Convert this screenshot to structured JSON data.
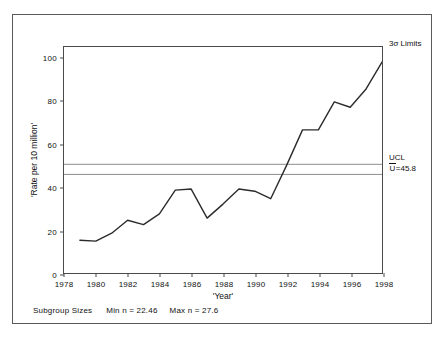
{
  "chart_data": {
    "type": "line",
    "title": "",
    "xlabel": "'Year'",
    "ylabel": "'Rate per 10 million'",
    "x": [
      1979,
      1980,
      1981,
      1982,
      1983,
      1984,
      1985,
      1986,
      1987,
      1988,
      1989,
      1990,
      1991,
      1992,
      1993,
      1994,
      1995,
      1996,
      1997,
      1998
    ],
    "values": [
      15.2,
      14.8,
      18.5,
      24.5,
      22.5,
      27.5,
      38.5,
      39.0,
      25.5,
      32.0,
      39.0,
      38.0,
      34.5,
      50.0,
      66.5,
      66.5,
      79.5,
      77.0,
      85.5,
      98.0
    ],
    "xlim": [
      1978,
      1998
    ],
    "ylim": [
      0,
      105
    ],
    "xticks": [
      1978,
      1980,
      1982,
      1984,
      1986,
      1988,
      1990,
      1992,
      1994,
      1996,
      1998
    ],
    "yticks": [
      0,
      20,
      40,
      60,
      80,
      100
    ],
    "grid": false,
    "legend": "none",
    "control_lines": [
      {
        "name": "UCL",
        "value": 50.5
      },
      {
        "name": "CL",
        "value": 45.8
      }
    ]
  },
  "annotations": {
    "sigma_limits": "3σ Limits",
    "ucl": "UCL",
    "centerline_prefix": "U",
    "centerline_value": "=45.8"
  },
  "footer": {
    "subgroup_sizes_label": "Subgroup Sizes",
    "min_n": "Min n = 22.46",
    "max_n": "Max n = 27.6"
  },
  "axis_labels": {
    "y_title": "'Rate per 10 million'",
    "x_title": "'Year'",
    "yticks": [
      "0",
      "20",
      "40",
      "60",
      "80",
      "100"
    ],
    "xticks": [
      "1978",
      "1980",
      "1982",
      "1984",
      "1986",
      "1988",
      "1990",
      "1992",
      "1994",
      "1996",
      "1998"
    ]
  },
  "colors": {
    "series": "#2b2b2b",
    "control_line": "#8c8c8c",
    "axis": "#4a4a4a",
    "border": "#5a5a5a",
    "background": "#ffffff"
  }
}
